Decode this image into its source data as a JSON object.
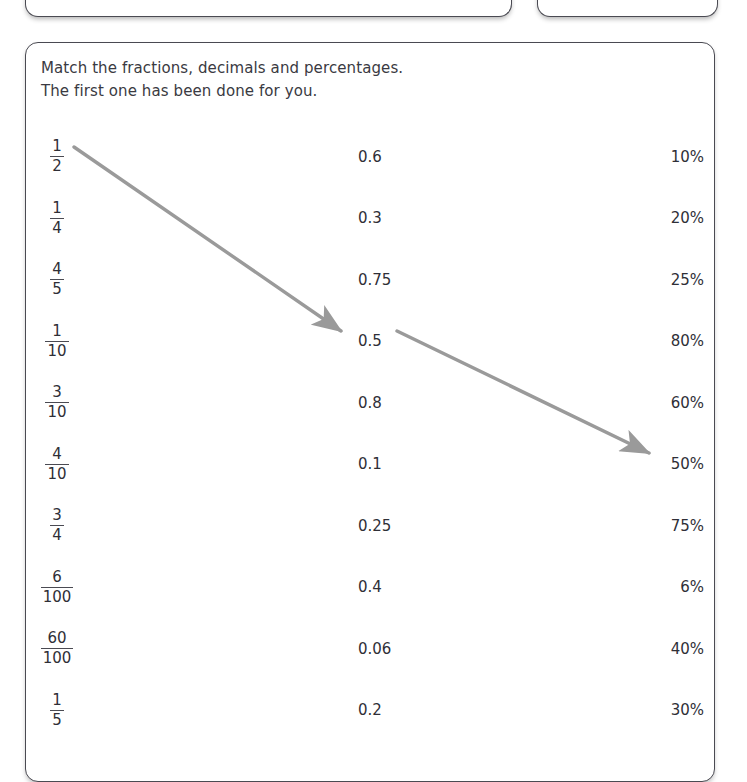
{
  "worksheet": {
    "instruction_line_1": "Match the fractions, decimals and percentages.",
    "instruction_line_2": "The first one has been done for you.",
    "rows": [
      {
        "fraction_numerator": "1",
        "fraction_denominator": "2",
        "decimal": "0.6",
        "percent": "10%"
      },
      {
        "fraction_numerator": "1",
        "fraction_denominator": "4",
        "decimal": "0.3",
        "percent": "20%"
      },
      {
        "fraction_numerator": "4",
        "fraction_denominator": "5",
        "decimal": "0.75",
        "percent": "25%"
      },
      {
        "fraction_numerator": "1",
        "fraction_denominator": "10",
        "decimal": "0.5",
        "percent": "80%"
      },
      {
        "fraction_numerator": "3",
        "fraction_denominator": "10",
        "decimal": "0.8",
        "percent": "60%"
      },
      {
        "fraction_numerator": "4",
        "fraction_denominator": "10",
        "decimal": "0.1",
        "percent": "50%"
      },
      {
        "fraction_numerator": "3",
        "fraction_denominator": "4",
        "decimal": "0.25",
        "percent": "75%"
      },
      {
        "fraction_numerator": "6",
        "fraction_denominator": "100",
        "decimal": "0.4",
        "percent": "6%"
      },
      {
        "fraction_numerator": "60",
        "fraction_denominator": "100",
        "decimal": "0.06",
        "percent": "40%"
      },
      {
        "fraction_numerator": "1",
        "fraction_denominator": "5",
        "decimal": "0.2",
        "percent": "30%"
      }
    ],
    "answer_arrows": [
      {
        "from_label": "1/2",
        "to_label": "0.5",
        "color": "#9a9a9a"
      },
      {
        "from_label": "0.5",
        "to_label": "50%",
        "color": "#9a9a9a"
      }
    ]
  },
  "top_cards": [
    {
      "label": ""
    },
    {
      "label": ""
    }
  ]
}
